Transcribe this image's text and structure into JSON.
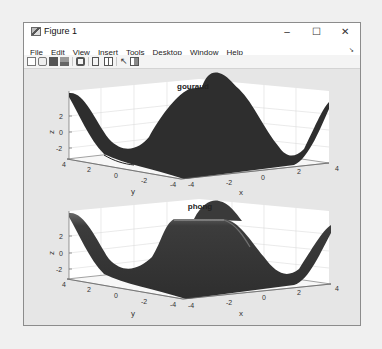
{
  "window": {
    "title": "Figure 1",
    "controls": {
      "minimize": "–",
      "maximize": "☐",
      "close": "✕"
    }
  },
  "menubar": {
    "items": [
      {
        "label": "File"
      },
      {
        "label": "Edit"
      },
      {
        "label": "View"
      },
      {
        "label": "Insert"
      },
      {
        "label": "Tools"
      },
      {
        "label": "Desktop"
      },
      {
        "label": "Window"
      },
      {
        "label": "Help"
      }
    ],
    "dock_arrow": "➘"
  },
  "toolbar": {
    "buttons": [
      "new-figure",
      "open-file",
      "save",
      "print",
      "print-preview",
      "link-plot",
      "insert-colorbar",
      "edit-plot",
      "property-inspector"
    ]
  },
  "plots": [
    {
      "title": "gouraud",
      "zlabel": "z",
      "ylabel": "y",
      "xlabel": "x",
      "z_ticks": [
        "2",
        "0",
        "-2"
      ],
      "y_ticks": [
        "4",
        "2",
        "0",
        "-2",
        "-4"
      ],
      "x_ticks": [
        "-4",
        "-2",
        "0",
        "2",
        "4"
      ],
      "surface_color": "#2e2e2e"
    },
    {
      "title": "phong",
      "zlabel": "z",
      "ylabel": "y",
      "xlabel": "x",
      "z_ticks": [
        "2",
        "0",
        "-2"
      ],
      "y_ticks": [
        "4",
        "2",
        "0",
        "-2",
        "-4"
      ],
      "x_ticks": [
        "-4",
        "-2",
        "0",
        "2",
        "4"
      ],
      "surface_color": "#3a3a3a"
    }
  ]
}
